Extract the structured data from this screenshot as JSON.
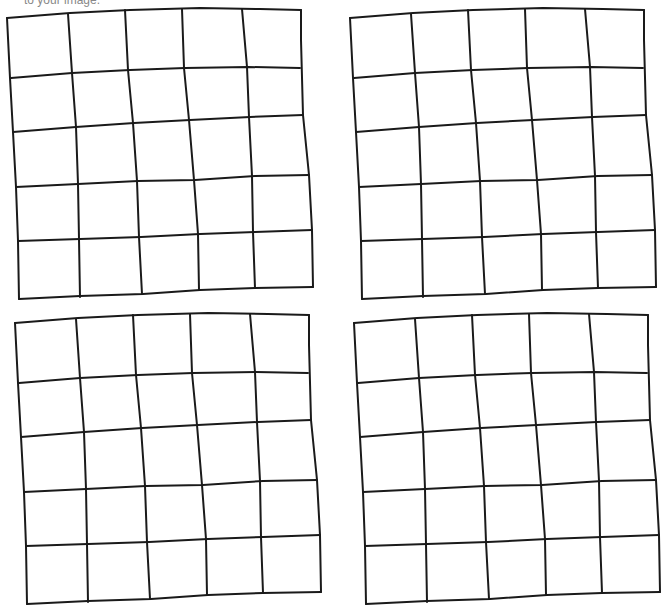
{
  "caption": "to your image.",
  "grids": [
    {
      "id": "grid-top-left",
      "rows": 5,
      "cols": 5
    },
    {
      "id": "grid-top-right",
      "rows": 5,
      "cols": 5
    },
    {
      "id": "grid-bottom-left",
      "rows": 5,
      "cols": 5
    },
    {
      "id": "grid-bottom-right",
      "rows": 5,
      "cols": 5
    }
  ]
}
